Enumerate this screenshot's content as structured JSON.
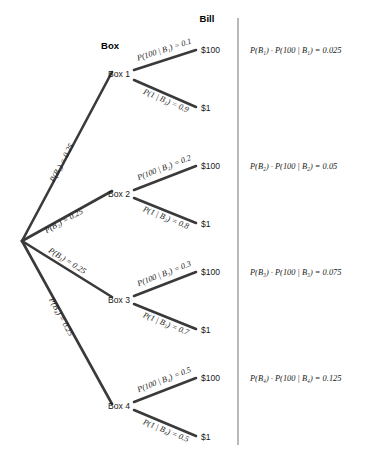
{
  "headers": {
    "box": "Box",
    "bill": "Bill"
  },
  "root": {
    "name": "root-node"
  },
  "branches": [
    {
      "node_label": "Box 1",
      "prior_label": "P(B₁) = 0.25",
      "prior_value": 0.25,
      "upper": {
        "edge_label": "P(100 | B₁) = 0.1",
        "value": 0.1,
        "leaf": "$100"
      },
      "lower": {
        "edge_label": "P(1 | B₁) = 0.9",
        "value": 0.9,
        "leaf": "$1"
      },
      "result_label": "P(B₁) · P(100 | B₁) = 0.025",
      "result_value": 0.025
    },
    {
      "node_label": "Box 2",
      "prior_label": "P(B₂) = 0.25",
      "prior_value": 0.25,
      "upper": {
        "edge_label": "P(100 | B₂) = 0.2",
        "value": 0.2,
        "leaf": "$100"
      },
      "lower": {
        "edge_label": "P(1 | B₂) = 0.8",
        "value": 0.8,
        "leaf": "$1"
      },
      "result_label": "P(B₂) · P(100 | B₂) = 0.05",
      "result_value": 0.05
    },
    {
      "node_label": "Box 3",
      "prior_label": "P(B₃) = 0.25",
      "prior_value": 0.25,
      "upper": {
        "edge_label": "P(100 | B₃) = 0.3",
        "value": 0.3,
        "leaf": "$100"
      },
      "lower": {
        "edge_label": "P(1 | B₃) = 0.7",
        "value": 0.7,
        "leaf": "$1"
      },
      "result_label": "P(B₃) · P(100 | B₃) = 0.075",
      "result_value": 0.075
    },
    {
      "node_label": "Box 4",
      "prior_label": "P(B₄) = 0.25",
      "prior_value": 0.25,
      "upper": {
        "edge_label": "P(100 | B₄) = 0.5",
        "value": 0.5,
        "leaf": "$100"
      },
      "lower": {
        "edge_label": "P(1 | B₄) = 0.5",
        "value": 0.5,
        "leaf": "$1"
      },
      "result_label": "P(B₄) · P(100 | B₄) = 0.125",
      "result_value": 0.125
    }
  ],
  "colors": {
    "line": "#3a3a3a",
    "divider": "#8a8a8a",
    "text": "#1a1a1a",
    "background": "#ffffff"
  }
}
